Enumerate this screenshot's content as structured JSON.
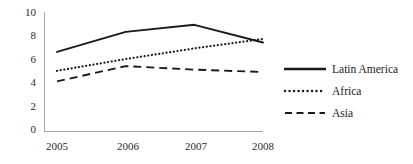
{
  "chart_data": {
    "type": "line",
    "title": "",
    "xlabel": "",
    "ylabel": "",
    "categories": [
      "2005",
      "2006",
      "2007",
      "2008"
    ],
    "x_tick_labels": [
      "2005",
      "2006",
      "2007",
      "2008"
    ],
    "y_tick_labels": [
      "0",
      "2",
      "4",
      "6",
      "8",
      "10"
    ],
    "y_ticks": [
      0,
      2,
      4,
      6,
      8,
      10
    ],
    "ylim": [
      0,
      10
    ],
    "grid": false,
    "legend_position": "right",
    "series": [
      {
        "name": "Latin America",
        "style": "solid",
        "color": "#1a1a1a",
        "values": [
          6.7,
          8.4,
          9.0,
          7.5
        ]
      },
      {
        "name": "Africa",
        "style": "dotted",
        "color": "#1a1a1a",
        "values": [
          5.1,
          6.1,
          7.0,
          7.8
        ]
      },
      {
        "name": "Asia",
        "style": "dashed",
        "color": "#1a1a1a",
        "values": [
          4.2,
          5.5,
          5.2,
          5.0
        ]
      }
    ]
  },
  "axis": {
    "line_color": "#a6a6a6",
    "y_labels": [
      {
        "text": "10",
        "top": 7
      },
      {
        "text": "8",
        "top": 30
      },
      {
        "text": "6",
        "top": 54
      },
      {
        "text": "8_dup",
        "top": 0
      }
    ]
  },
  "y_axis": {
    "labels": [
      "10",
      "8",
      "6",
      "4",
      "2",
      "0"
    ]
  },
  "x_axis": {
    "labels": [
      "2005",
      "2006",
      "2007",
      "2008"
    ]
  },
  "legend": {
    "items": [
      {
        "label": "Latin America",
        "style": "solid"
      },
      {
        "label": "Africa",
        "style": "dotted"
      },
      {
        "label": "Asia",
        "style": "dashed"
      }
    ]
  }
}
